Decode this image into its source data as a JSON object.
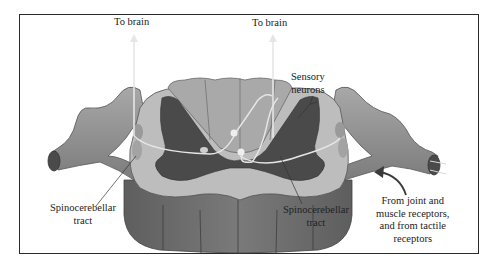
{
  "diagram": {
    "labels": {
      "to_brain_left": "To brain",
      "to_brain_right": "To brain",
      "sensory_neurons_line1": "Sensory",
      "sensory_neurons_line2": "neurons",
      "spino_left_line1": "Spinocerebellar",
      "spino_left_line2": "tract",
      "spino_right_line1": "Spinocerebellar",
      "spino_right_line2": "tract",
      "receptors_line1": "From joint and",
      "receptors_line2": "muscle receptors,",
      "receptors_line3": "and from tactile",
      "receptors_line4": "receptors"
    },
    "colors": {
      "white_matter": "#bdbdbd",
      "gray_matter": "#4a4a4a",
      "column_side": "#6e6e6e",
      "nerve": "#8c8c8c",
      "tract_arrow": "#e6e6e6",
      "frame": "#2a2a2a"
    }
  }
}
